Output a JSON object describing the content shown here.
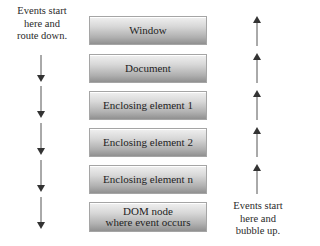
{
  "diagram": {
    "left_caption": "Events start\nhere and\nroute down.",
    "right_caption": "Events start\nhere and\nbubble up.",
    "left_caption_lines": [
      "Events start",
      "here and",
      "route down."
    ],
    "right_caption_lines": [
      "Events start",
      "here and",
      "bubble up."
    ],
    "boxes": [
      {
        "label": "Window"
      },
      {
        "label": "Document"
      },
      {
        "label": "Enclosing element 1"
      },
      {
        "label": "Enclosing element 2"
      },
      {
        "label": "Enclosing element n"
      },
      {
        "label_lines": [
          "DOM node",
          "where event occurs"
        ]
      }
    ],
    "left_arrows": {
      "direction": "down",
      "count": 5
    },
    "right_arrows": {
      "direction": "up",
      "count": 5
    },
    "colors": {
      "arrow": "#333333",
      "box_top": "#f0f0f0",
      "box_bottom": "#909090",
      "text": "#1e1e1e"
    }
  }
}
